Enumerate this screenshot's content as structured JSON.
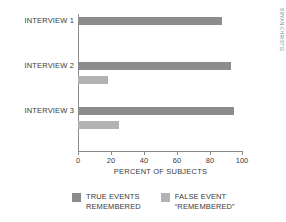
{
  "chart_data": {
    "type": "bar",
    "orientation": "horizontal",
    "title": "",
    "xlabel": "PERCENT OF SUBJECTS",
    "ylabel": "",
    "xlim": [
      0,
      100
    ],
    "xticks": [
      0,
      20,
      40,
      60,
      80,
      100
    ],
    "xtick_labels": [
      "0",
      "20",
      "40",
      "60",
      "80",
      "100"
    ],
    "grid": false,
    "legend_position": "bottom",
    "categories": [
      "INTERVIEW 1",
      "INTERVIEW 2",
      "INTERVIEW 3"
    ],
    "series": [
      {
        "name": "TRUE EVENTS REMEMBERED",
        "color": "#8c8c8c",
        "values": [
          88,
          93,
          95
        ]
      },
      {
        "name": "FALSE EVENT “REMEMBERED”",
        "color": "#b3b3b3",
        "values": [
          0,
          18,
          25
        ]
      }
    ]
  },
  "axis": {
    "x_title": "PERCENT OF SUBJECTS",
    "ticks": [
      "0",
      "20",
      "40",
      "60",
      "80",
      "100"
    ]
  },
  "categories": [
    {
      "label": "INTERVIEW 1"
    },
    {
      "label": "INTERVIEW 2"
    },
    {
      "label": "INTERVIEW 3"
    }
  ],
  "legend": {
    "items": [
      {
        "line1": "TRUE EVENTS",
        "line2": "REMEMBERED",
        "color": "#8c8c8c"
      },
      {
        "line1": "FALSE EVENT",
        "line2": "“REMEMBERED”",
        "color": "#b3b3b3"
      }
    ]
  },
  "credit": {
    "text": "BRYAN CHRISTIE"
  },
  "colors": {
    "true_series": "#8c8c8c",
    "false_series": "#b3b3b3",
    "axis": "#8a8a8a",
    "text": "#3a3a3a",
    "background": "#ffffff"
  }
}
